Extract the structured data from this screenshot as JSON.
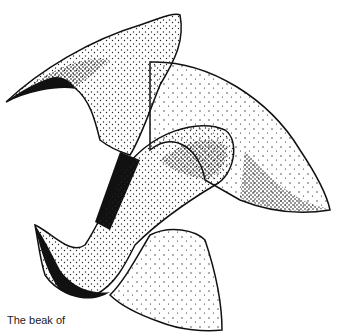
{
  "illustration": {
    "subject": "beak-illustration",
    "caption": "The beak of",
    "ink_color": "#111111",
    "paper_color": "#ffffff"
  }
}
